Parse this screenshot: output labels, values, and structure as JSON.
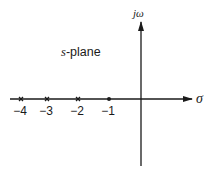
{
  "diagram": {
    "plane_label_var": "s",
    "plane_label_rest": "-plane",
    "axes": {
      "horizontal_label": "σ",
      "vertical_label": "jω"
    },
    "points": [
      {
        "value": -4,
        "label": "−4",
        "marker": "x"
      },
      {
        "value": -3,
        "label": "−3",
        "marker": "x"
      },
      {
        "value": -2,
        "label": "−2",
        "marker": "x"
      },
      {
        "value": -1,
        "label": "−1",
        "marker": "dot"
      }
    ],
    "colors": {
      "ink": "#1a1a1a",
      "background": "#ffffff"
    }
  }
}
